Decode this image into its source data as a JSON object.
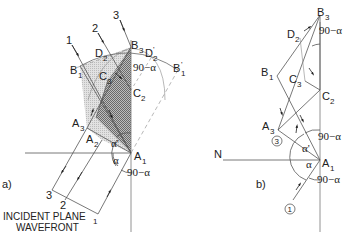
{
  "figure": {
    "panel_a": {
      "label": "a)",
      "caption_line1": "INCIDENT PLANE",
      "caption_line2": "WAVEFRONT",
      "rays": [
        "1",
        "2",
        "3"
      ],
      "wavefront_points": [
        "3",
        "2",
        "1"
      ],
      "points": {
        "A1": {
          "main": "A",
          "sub": "1"
        },
        "A2": {
          "main": "A",
          "sub": "2"
        },
        "A3": {
          "main": "A",
          "sub": "3"
        },
        "B1": {
          "main": "B",
          "sub": "1"
        },
        "B1p": {
          "main": "B",
          "sub": "1",
          "prime": "'"
        },
        "B3": {
          "main": "B",
          "sub": "3"
        },
        "C2": {
          "main": "C",
          "sub": "2"
        },
        "C3": {
          "main": "C",
          "sub": "3"
        },
        "D2": {
          "main": "D",
          "sub": "2"
        },
        "D2p": {
          "main": "D",
          "sub": "2",
          "prime": "'"
        }
      },
      "angles": {
        "top": "90−α",
        "alpha_prime": "α'",
        "alpha": "α",
        "bottom": "90−α"
      }
    },
    "panel_b": {
      "label": "b)",
      "normal_label": "N",
      "circled_1": "1",
      "circled_3": "3",
      "points": {
        "A1": {
          "main": "A",
          "sub": "1"
        },
        "A3": {
          "main": "A",
          "sub": "3"
        },
        "B1": {
          "main": "B",
          "sub": "1"
        },
        "B3": {
          "main": "B",
          "sub": "3"
        },
        "C2": {
          "main": "C",
          "sub": "2"
        },
        "C3": {
          "main": "C",
          "sub": "3"
        },
        "D2": {
          "main": "D",
          "sub": "2"
        }
      },
      "angles": {
        "top": "90−α",
        "mid_top": "90−α",
        "alpha_prime": "α'",
        "alpha": "α",
        "bottom": "90−α"
      }
    },
    "colors": {
      "line": "#555555",
      "light_shade": "#d9d9d9",
      "dark_shade": "#8a8a8a",
      "dashed": "#9a9a9a"
    }
  }
}
